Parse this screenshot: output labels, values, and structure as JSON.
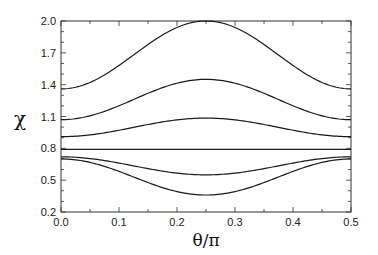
{
  "chart_data": {
    "type": "line",
    "title": "",
    "xlabel": "θ/π",
    "ylabel": "χ",
    "xlim": [
      0.0,
      0.5
    ],
    "ylim": [
      0.2,
      2.0
    ],
    "x_ticks": [
      0.0,
      0.1,
      0.2,
      0.3,
      0.4,
      0.5
    ],
    "x_tick_labels": [
      "0.0",
      "0.1",
      "0.2",
      "0.3",
      "0.4",
      "0.5"
    ],
    "y_ticks": [
      0.2,
      0.5,
      0.8,
      1.1,
      1.4,
      1.7,
      2.0
    ],
    "y_tick_labels": [
      "0.2",
      "0.5",
      "0.8",
      "1.1",
      "1.4",
      "1.7",
      "2.0"
    ],
    "x_minor_step": 0.05,
    "y_minor_step": 0.1,
    "grid": false,
    "legend": null,
    "series": [
      {
        "name": "curve-1",
        "edge_value": 1.36,
        "center_value": 2.0
      },
      {
        "name": "curve-2",
        "edge_value": 1.07,
        "center_value": 1.45
      },
      {
        "name": "curve-3",
        "edge_value": 0.91,
        "center_value": 1.085
      },
      {
        "name": "curve-4",
        "edge_value": 0.79,
        "center_value": 0.79
      },
      {
        "name": "curve-5",
        "edge_value": 0.72,
        "center_value": 0.55
      },
      {
        "name": "curve-6",
        "edge_value": 0.7,
        "center_value": 0.36
      }
    ],
    "shape_note": "each curve symmetric about θ/π = 0.25: χ = edge + (center − edge)·sin²(2πx)",
    "sample_x": [
      0.0,
      0.05,
      0.1,
      0.15,
      0.2,
      0.25,
      0.3,
      0.35,
      0.4,
      0.45,
      0.5
    ]
  },
  "style": {
    "line_color": "#1a1a1a",
    "axis_color": "#333333"
  }
}
